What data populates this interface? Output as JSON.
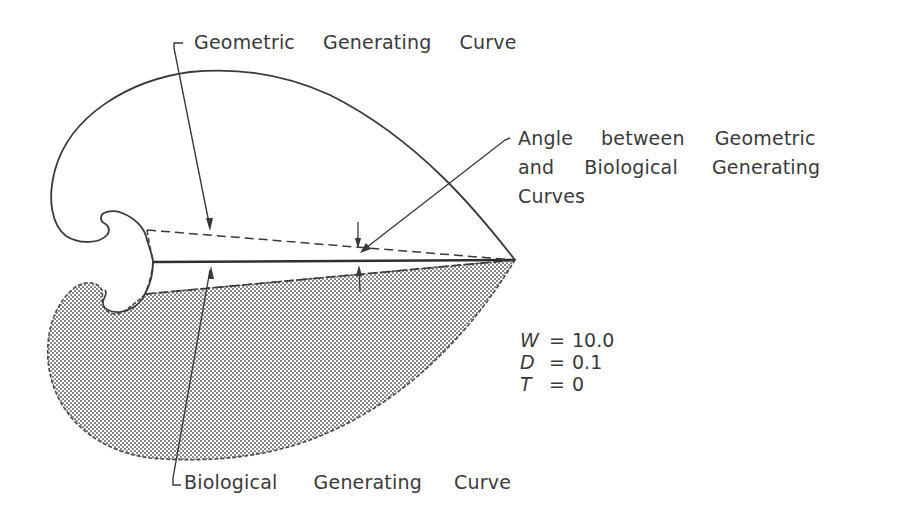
{
  "figure": {
    "labels": {
      "geometric_curve": [
        "Geometric",
        "Generating",
        "Curve"
      ],
      "angle_line1": [
        "Angle",
        "between",
        "Geometric"
      ],
      "angle_line2": [
        "and",
        "Biological",
        "Generating"
      ],
      "angle_line3": "Curves",
      "biological_curve": [
        "Biological",
        "Generating",
        "Curve"
      ]
    },
    "parameters": [
      {
        "name": "W",
        "eq": "=",
        "value": "10.0"
      },
      {
        "name": "D",
        "eq": "=",
        "value": "0.1"
      },
      {
        "name": "T",
        "eq": "=",
        "value": "0"
      }
    ],
    "colors": {
      "ink": "#3a3a3a",
      "shade": "#8a8a8a",
      "background": "#ffffff"
    }
  }
}
